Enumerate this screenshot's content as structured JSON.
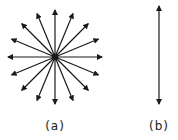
{
  "figure": {
    "panels": [
      {
        "id": "a",
        "label": "(a)",
        "description": "radial arrows from a common point",
        "arrow_count": 16,
        "center": [
          55,
          57
        ],
        "radius": 47,
        "angle_step_deg": 22.5
      },
      {
        "id": "b",
        "label": "(b)",
        "description": "double-headed vertical arrow",
        "x": 159,
        "y_top": 6,
        "y_bottom": 104
      }
    ],
    "colors": {
      "stroke": "#1a1a1a",
      "background": "#ffffff"
    }
  }
}
